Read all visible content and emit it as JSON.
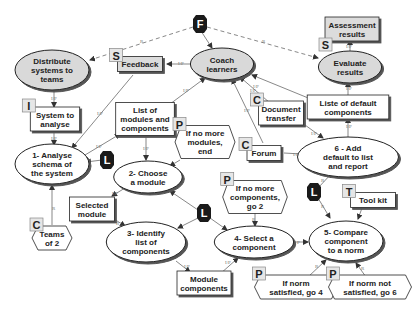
{
  "diagram": {
    "type": "activity-concept-map",
    "nodes": [
      {
        "id": "F",
        "kind": "tag-dark",
        "label": "F",
        "x": 200,
        "y": 24
      },
      {
        "id": "distribute",
        "kind": "ellipse-grey",
        "lines": [
          "Distribute",
          "systems to",
          "teams"
        ],
        "x": 52,
        "y": 70
      },
      {
        "id": "feedback",
        "kind": "rect-grey",
        "lines": [
          "Feedback"
        ],
        "x": 140,
        "y": 64,
        "tag": "S"
      },
      {
        "id": "coach",
        "kind": "ellipse-grey",
        "lines": [
          "Coach",
          "learners"
        ],
        "x": 222,
        "y": 64
      },
      {
        "id": "assessment",
        "kind": "rect-grey",
        "lines": [
          "Assessment",
          "results"
        ],
        "x": 352,
        "y": 29,
        "tag": "S"
      },
      {
        "id": "evaluate",
        "kind": "ellipse-grey",
        "lines": [
          "Evaluate",
          "results"
        ],
        "x": 350,
        "y": 67
      },
      {
        "id": "system_to_analyse",
        "kind": "rect",
        "lines": [
          "System to",
          "analyse"
        ],
        "x": 55,
        "y": 119,
        "tag": "I"
      },
      {
        "id": "list_modules",
        "kind": "rect",
        "lines": [
          "List of",
          "modules and",
          "components"
        ],
        "x": 145,
        "y": 119
      },
      {
        "id": "doc_transfer",
        "kind": "rect",
        "lines": [
          "Document",
          "transfer"
        ],
        "x": 281,
        "y": 113,
        "tag": "C"
      },
      {
        "id": "liste_default",
        "kind": "rect",
        "lines": [
          "Liste of default",
          "components"
        ],
        "x": 348,
        "y": 107
      },
      {
        "id": "if_no_modules",
        "kind": "hex",
        "lines": [
          "If no more",
          "modules,",
          "end"
        ],
        "x": 205,
        "y": 142,
        "tag": "P"
      },
      {
        "id": "forum",
        "kind": "rect",
        "lines": [
          "Forum"
        ],
        "x": 264,
        "y": 153,
        "tag": "C"
      },
      {
        "id": "add_default",
        "kind": "ellipse",
        "lines": [
          "6 - Add",
          "default to list",
          "and report"
        ],
        "x": 348,
        "y": 157
      },
      {
        "id": "analyse",
        "kind": "ellipse",
        "lines": [
          "1- Analyse",
          "schema of",
          "the system"
        ],
        "x": 52,
        "y": 164
      },
      {
        "id": "L1",
        "kind": "tag-dark",
        "label": "L",
        "x": 107,
        "y": 160
      },
      {
        "id": "choose",
        "kind": "ellipse",
        "lines": [
          "2- Choose",
          "a module"
        ],
        "x": 148,
        "y": 177
      },
      {
        "id": "selected_module",
        "kind": "rect",
        "lines": [
          "Selected",
          "module"
        ],
        "x": 92,
        "y": 209
      },
      {
        "id": "teams",
        "kind": "hex",
        "lines": [
          "Teams",
          "of 2"
        ],
        "x": 52,
        "y": 238,
        "tag": "C"
      },
      {
        "id": "L2",
        "kind": "tag-dark",
        "label": "L",
        "x": 204,
        "y": 213
      },
      {
        "id": "identify",
        "kind": "ellipse",
        "lines": [
          "3- Identify",
          "list of",
          "components"
        ],
        "x": 146,
        "y": 242
      },
      {
        "id": "if_no_components",
        "kind": "hex",
        "lines": [
          "If no more",
          "components,",
          "go 2"
        ],
        "x": 255,
        "y": 197,
        "tag": "P"
      },
      {
        "id": "L3",
        "kind": "tag-dark",
        "label": "L",
        "x": 314,
        "y": 192
      },
      {
        "id": "toolkit",
        "kind": "rect",
        "lines": [
          "Tool kit"
        ],
        "x": 373,
        "y": 200,
        "tag": "T"
      },
      {
        "id": "select_component",
        "kind": "ellipse",
        "lines": [
          "4- Select a",
          "component"
        ],
        "x": 254,
        "y": 242
      },
      {
        "id": "compare",
        "kind": "ellipse",
        "lines": [
          "5- Compare",
          "component",
          "to a norm"
        ],
        "x": 346,
        "y": 241
      },
      {
        "id": "module_components",
        "kind": "rect",
        "lines": [
          "Module",
          "components"
        ],
        "x": 204,
        "y": 283
      },
      {
        "id": "if_norm_satisfied",
        "kind": "hex",
        "lines": [
          "If norm",
          "satisfied, go 4"
        ],
        "x": 296,
        "y": 287,
        "tag": "P"
      },
      {
        "id": "if_norm_not_satisfied",
        "kind": "hex",
        "lines": [
          "If norm not",
          "satisfied, go 6"
        ],
        "x": 370,
        "y": 287,
        "tag": "P"
      }
    ],
    "edge_labels": [
      "I/P",
      "R",
      "I/P",
      "I/P",
      "I/P",
      "I/P",
      "I/P",
      "I/P",
      "I/P",
      "I/P",
      "I/P",
      "I/P",
      "R",
      "R",
      "R",
      "R",
      "R",
      "R",
      "R",
      "P",
      "R",
      "R"
    ]
  }
}
